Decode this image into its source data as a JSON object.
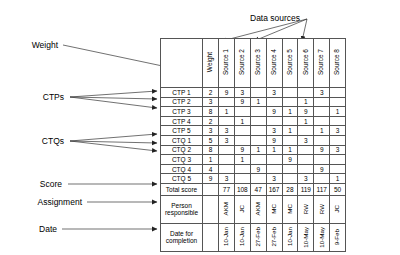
{
  "annotations": {
    "data_sources": "Data sources",
    "weight": "Weight",
    "ctps": "CTPs",
    "ctqs": "CTQs",
    "score": "Score",
    "assignment": "Assignment",
    "date": "Date"
  },
  "table": {
    "weight_header": "Weight",
    "source_headers": [
      "Source 1",
      "Source 2",
      "Source 3",
      "Source 4",
      "Source 5",
      "Source 6",
      "Source 7",
      "Source 8"
    ],
    "rows": [
      {
        "label": "CTP 1",
        "weight": "2",
        "values": [
          "9",
          "3",
          "",
          "3",
          "",
          "",
          "3",
          ""
        ]
      },
      {
        "label": "CTP 2",
        "weight": "3",
        "values": [
          "",
          "9",
          "1",
          "",
          "",
          "1",
          "",
          ""
        ]
      },
      {
        "label": "CTP 3",
        "weight": "8",
        "values": [
          "1",
          "",
          "",
          "9",
          "1",
          "9",
          "",
          "1"
        ]
      },
      {
        "label": "CTP 4",
        "weight": "2",
        "values": [
          "",
          "1",
          "",
          "",
          "",
          "1",
          "",
          ""
        ]
      },
      {
        "label": "CTP 5",
        "weight": "3",
        "values": [
          "3",
          "",
          "",
          "3",
          "1",
          "",
          "1",
          "3"
        ]
      },
      {
        "label": "CTQ 1",
        "weight": "5",
        "values": [
          "3",
          "",
          "",
          "9",
          "",
          "3",
          "",
          ""
        ]
      },
      {
        "label": "CTQ 2",
        "weight": "8",
        "values": [
          "",
          "9",
          "1",
          "1",
          "1",
          "",
          "9",
          "3"
        ]
      },
      {
        "label": "CTQ 3",
        "weight": "1",
        "values": [
          "",
          "1",
          "",
          "",
          "9",
          "",
          "",
          ""
        ]
      },
      {
        "label": "CTQ 4",
        "weight": "4",
        "values": [
          "",
          "",
          "9",
          "",
          "",
          "",
          "9",
          ""
        ]
      },
      {
        "label": "CTQ 5",
        "weight": "9",
        "values": [
          "3",
          "",
          "",
          "3",
          "",
          "3",
          "",
          "1"
        ]
      }
    ],
    "total_row": {
      "label": "Total score",
      "weight": "",
      "values": [
        "77",
        "108",
        "47",
        "167",
        "28",
        "119",
        "117",
        "50"
      ]
    },
    "person_row": {
      "label": "Person responsible",
      "weight": "",
      "values": [
        "AKM",
        "JC",
        "AKM",
        "MC",
        "MC",
        "RW",
        "RW",
        "JC"
      ]
    },
    "date_row": {
      "label": "Date for completion",
      "weight": "",
      "values": [
        "10-Jan",
        "10-Jan",
        "27-Feb",
        "27-Feb",
        "10-Jan",
        "10-May",
        "10-May",
        "9-Feb"
      ]
    }
  },
  "colors": {
    "line": "#333333",
    "border": "#555555",
    "text": "#000000",
    "background": "#ffffff"
  }
}
